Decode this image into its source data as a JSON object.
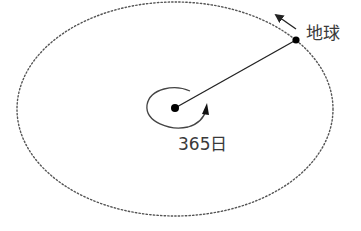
{
  "diagram": {
    "type": "orbit",
    "labels": {
      "earth": "地球",
      "period": "365日"
    },
    "colors": {
      "orbit": "#555555",
      "line": "#222222",
      "dots": "#000000",
      "text": "#3a3a3a"
    },
    "elements": [
      {
        "name": "orbit-ellipse",
        "style": "dotted"
      },
      {
        "name": "sun-center-dot"
      },
      {
        "name": "earth-dot"
      },
      {
        "name": "radius-line"
      },
      {
        "name": "orbit-direction-arrow"
      },
      {
        "name": "rotation-arrow"
      }
    ]
  }
}
